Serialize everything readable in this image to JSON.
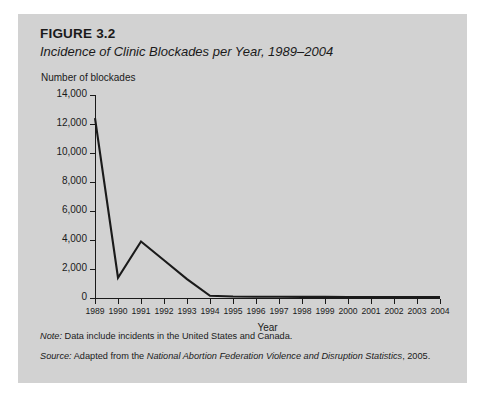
{
  "figure": {
    "number": "FIGURE 3.2",
    "title": "Incidence of Clinic Blockades per Year, 1989–2004"
  },
  "notes": {
    "note_label": "Note:",
    "note_text": " Data include incidents in the United States and Canada.",
    "source_label": "Source:",
    "source_text_before": " Adapted from the ",
    "source_italic": "National Abortion Federation Violence and Disruption Statistics",
    "source_text_after": ", 2005."
  },
  "chart_data": {
    "type": "line",
    "title": "Incidence of Clinic Blockades per Year, 1989–2004",
    "xlabel": "Year",
    "ylabel": "Number of blockades",
    "grid": false,
    "legend": "none",
    "xlim": [
      1989,
      2004
    ],
    "ylim": [
      0,
      14000
    ],
    "ytick_labels": [
      "0",
      "2,000",
      "4,000",
      "6,000",
      "8,000",
      "10,000",
      "12,000",
      "14,000"
    ],
    "yticks": [
      0,
      2000,
      4000,
      6000,
      8000,
      10000,
      12000,
      14000
    ],
    "categories": [
      "1989",
      "1990",
      "1991",
      "1992",
      "1993",
      "1994",
      "1995",
      "1996",
      "1997",
      "1998",
      "1999",
      "2000",
      "2001",
      "2002",
      "2003",
      "2004"
    ],
    "x": [
      1989,
      1990,
      1991,
      1992,
      1993,
      1994,
      1995,
      1996,
      1997,
      1998,
      1999,
      2000,
      2001,
      2002,
      2003,
      2004
    ],
    "values": [
      12400,
      1400,
      3900,
      2600,
      1300,
      150,
      100,
      90,
      90,
      80,
      80,
      70,
      70,
      70,
      60,
      60
    ],
    "series": [
      {
        "name": "Number of blockades",
        "color": "#1a1a1a",
        "values": [
          12400,
          1400,
          3900,
          2600,
          1300,
          150,
          100,
          90,
          90,
          80,
          80,
          70,
          70,
          70,
          60,
          60
        ]
      }
    ]
  },
  "colors": {
    "figure_background": "#d2d2d2",
    "page_background": "#ffffff",
    "line": "#1a1a1a",
    "axis": "#1a1a1a",
    "text": "#1a1a1a"
  }
}
